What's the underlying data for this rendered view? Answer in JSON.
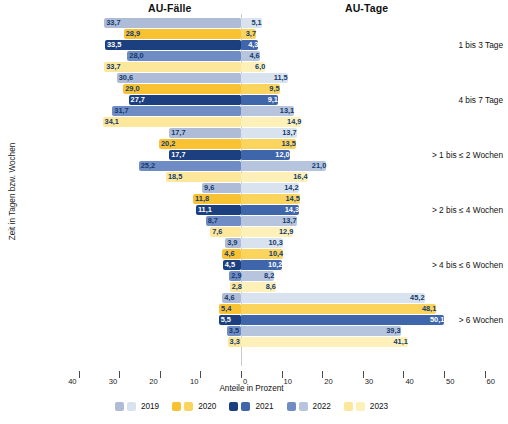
{
  "headers": {
    "left": "AU-Fälle",
    "right": "AU-Tage"
  },
  "axis": {
    "title": "Anteile in Prozent",
    "y_title": "Zeit in Tagen bzw. Wochen",
    "ticks": [
      "40",
      "30",
      "20",
      "10",
      "0",
      "10",
      "20",
      "30",
      "40",
      "50",
      "60"
    ]
  },
  "legend": {
    "items": [
      {
        "label": "2019",
        "color_left": "#aebcd8",
        "color_right": "#d9e3f0"
      },
      {
        "label": "2020",
        "color_left": "#f9c233",
        "color_right": "#fbd45e"
      },
      {
        "label": "2021",
        "color_left": "#1c3f80",
        "color_right": "#3f66ab"
      },
      {
        "label": "2022",
        "color_left": "#6f8cc4",
        "color_right": "#b6c4de"
      },
      {
        "label": "2023",
        "color_left": "#fde79a",
        "color_right": "#fdf0b9"
      }
    ]
  },
  "chart_data": {
    "type": "bar",
    "xlabel": "Anteile in Prozent",
    "ylabel": "Zeit in Tagen bzw. Wochen",
    "xlim": [
      -40,
      60
    ],
    "grid": false,
    "legend_position": "bottom",
    "categories": [
      "1 bis 3 Tage",
      "4 bis 7 Tage",
      "> 1 bis ≤ 2 Wochen",
      "> 2 bis ≤ 4 Wochen",
      "> 4 bis ≤ 6 Wochen",
      "> 6 Wochen"
    ],
    "series": [
      {
        "name": "2019",
        "au_faelle": [
          33.7,
          30.6,
          17.7,
          9.6,
          3.9,
          4.6
        ],
        "au_tage": [
          5.1,
          11.5,
          13.7,
          14.2,
          10.3,
          45.2
        ]
      },
      {
        "name": "2020",
        "au_faelle": [
          28.9,
          29.0,
          20.2,
          11.8,
          4.6,
          5.4
        ],
        "au_tage": [
          3.7,
          9.5,
          13.5,
          14.5,
          10.4,
          48.1
        ]
      },
      {
        "name": "2021",
        "au_faelle": [
          33.5,
          27.7,
          17.7,
          11.1,
          4.5,
          5.5
        ],
        "au_tage": [
          4.3,
          9.1,
          12.0,
          14.3,
          10.2,
          50.1
        ]
      },
      {
        "name": "2022",
        "au_faelle": [
          28.0,
          31.7,
          25.2,
          8.7,
          2.9,
          3.5
        ],
        "au_tage": [
          4.6,
          13.1,
          21.0,
          13.7,
          8.2,
          39.3
        ]
      },
      {
        "name": "2023",
        "au_faelle": [
          33.7,
          34.1,
          18.5,
          7.6,
          2.8,
          3.3
        ],
        "au_tage": [
          6.0,
          14.9,
          16.4,
          12.9,
          8.6,
          41.1
        ]
      }
    ],
    "labels": {
      "au_faelle": [
        [
          "33,7",
          "28,9",
          "33,5",
          "28,0",
          "33,7"
        ],
        [
          "30,6",
          "29,0",
          "27,7",
          "31,7",
          "34,1"
        ],
        [
          "17,7",
          "20,2",
          "17,7",
          "25,2",
          "18,5"
        ],
        [
          "9,6",
          "11,8",
          "11,1",
          "8,7",
          "7,6"
        ],
        [
          "3,9",
          "4,6",
          "4,5",
          "2,9",
          "2,8"
        ],
        [
          "4,6",
          "5,4",
          "5,5",
          "3,5",
          "3,3"
        ]
      ],
      "au_tage": [
        [
          "5,1",
          "3,7",
          "4,3",
          "4,6",
          "6,0"
        ],
        [
          "11,5",
          "9,5",
          "9,1",
          "13,1",
          "14,9"
        ],
        [
          "13,7",
          "13,5",
          "12,0",
          "21,0",
          "16,4"
        ],
        [
          "14,2",
          "14,5",
          "14,3",
          "13,7",
          "12,9"
        ],
        [
          "10,3",
          "10,4",
          "10,2",
          "8,2",
          "8,6"
        ],
        [
          "45,2",
          "48,1",
          "50,1",
          "39,3",
          "41,1"
        ]
      ]
    }
  }
}
